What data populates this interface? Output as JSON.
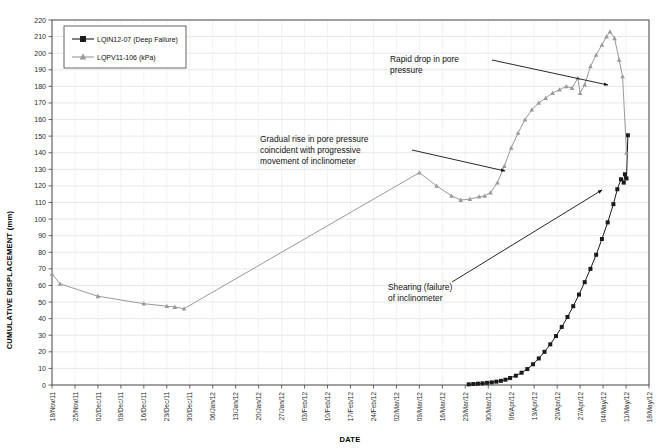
{
  "chart_data": {
    "type": "line",
    "title": "",
    "xlabel": "DATE",
    "ylabel": "CUMULATIVE DISPLACEMENT (mm)",
    "ylim": [
      0,
      220
    ],
    "ytick_step": 10,
    "grid": true,
    "legend_position": "top-left",
    "categories": [
      "18/Nov/11",
      "25/Nov/11",
      "02/Dec/11",
      "09/Dec/11",
      "16/Dec/11",
      "23/Dec/11",
      "30/Dec/11",
      "06/Jan/12",
      "13/Jan/12",
      "20/Jan/12",
      "27/Jan/12",
      "03/Feb/12",
      "10/Feb/12",
      "17/Feb/12",
      "24/Feb/12",
      "02/Mar/12",
      "09/Mar/12",
      "16/Mar/12",
      "23/Mar/12",
      "30/Mar/12",
      "06/Apr/12",
      "13/Apr/12",
      "20/Apr/12",
      "27/Apr/12",
      "04/May/12",
      "11/May/12",
      "18/May/12"
    ],
    "yticks": [
      0,
      10,
      20,
      30,
      40,
      50,
      60,
      70,
      80,
      90,
      100,
      110,
      120,
      130,
      140,
      150,
      160,
      170,
      180,
      190,
      200,
      210,
      220
    ],
    "series": [
      {
        "name": "LQIN12-07 (Deep Failure)",
        "color": "#1a1a1a",
        "marker": "square",
        "points": [
          {
            "x": 18.15,
            "y": 0.4
          },
          {
            "x": 18.35,
            "y": 0.6
          },
          {
            "x": 18.55,
            "y": 0.8
          },
          {
            "x": 18.75,
            "y": 1.0
          },
          {
            "x": 18.95,
            "y": 1.3
          },
          {
            "x": 19.15,
            "y": 1.6
          },
          {
            "x": 19.35,
            "y": 2.0
          },
          {
            "x": 19.55,
            "y": 2.5
          },
          {
            "x": 19.75,
            "y": 3.2
          },
          {
            "x": 19.95,
            "y": 4.2
          },
          {
            "x": 20.2,
            "y": 5.6
          },
          {
            "x": 20.45,
            "y": 7.4
          },
          {
            "x": 20.7,
            "y": 9.6
          },
          {
            "x": 20.95,
            "y": 12.5
          },
          {
            "x": 21.2,
            "y": 16.0
          },
          {
            "x": 21.45,
            "y": 20.0
          },
          {
            "x": 21.7,
            "y": 24.5
          },
          {
            "x": 21.95,
            "y": 29.5
          },
          {
            "x": 22.2,
            "y": 35.0
          },
          {
            "x": 22.45,
            "y": 41.0
          },
          {
            "x": 22.7,
            "y": 47.5
          },
          {
            "x": 22.95,
            "y": 54.5
          },
          {
            "x": 23.2,
            "y": 62.0
          },
          {
            "x": 23.45,
            "y": 70.0
          },
          {
            "x": 23.7,
            "y": 78.5
          },
          {
            "x": 23.95,
            "y": 88.0
          },
          {
            "x": 24.2,
            "y": 98.0
          },
          {
            "x": 24.45,
            "y": 109.0
          },
          {
            "x": 24.62,
            "y": 118.0
          },
          {
            "x": 24.78,
            "y": 124.0
          },
          {
            "x": 24.9,
            "y": 122.0
          },
          {
            "x": 24.95,
            "y": 127.0
          },
          {
            "x": 25.02,
            "y": 124.5
          },
          {
            "x": 25.08,
            "y": 150.5
          }
        ]
      },
      {
        "name": "LQPV11-106 (kPa)",
        "color": "#9a9a9a",
        "marker": "triangle",
        "points": [
          {
            "x": 0.0,
            "y": 67.0
          },
          {
            "x": 0.35,
            "y": 61.0
          },
          {
            "x": 2.0,
            "y": 53.5
          },
          {
            "x": 4.0,
            "y": 49.0
          },
          {
            "x": 5.0,
            "y": 47.5
          },
          {
            "x": 5.35,
            "y": 47.0
          },
          {
            "x": 5.75,
            "y": 46.0
          },
          {
            "x": 16.0,
            "y": 128.0
          },
          {
            "x": 16.75,
            "y": 120.0
          },
          {
            "x": 17.4,
            "y": 114.0
          },
          {
            "x": 17.8,
            "y": 111.5
          },
          {
            "x": 18.2,
            "y": 112.0
          },
          {
            "x": 18.6,
            "y": 113.5
          },
          {
            "x": 18.85,
            "y": 114.0
          },
          {
            "x": 19.1,
            "y": 116.0
          },
          {
            "x": 19.4,
            "y": 122.0
          },
          {
            "x": 19.7,
            "y": 132.0
          },
          {
            "x": 20.0,
            "y": 143.0
          },
          {
            "x": 20.3,
            "y": 152.0
          },
          {
            "x": 20.6,
            "y": 160.0
          },
          {
            "x": 20.9,
            "y": 166.0
          },
          {
            "x": 21.2,
            "y": 170.0
          },
          {
            "x": 21.5,
            "y": 173.0
          },
          {
            "x": 21.8,
            "y": 176.0
          },
          {
            "x": 22.1,
            "y": 178.0
          },
          {
            "x": 22.4,
            "y": 180.0
          },
          {
            "x": 22.65,
            "y": 179.0
          },
          {
            "x": 22.9,
            "y": 185.0
          },
          {
            "x": 23.0,
            "y": 176.0
          },
          {
            "x": 23.2,
            "y": 181.0
          },
          {
            "x": 23.45,
            "y": 192.0
          },
          {
            "x": 23.7,
            "y": 199.0
          },
          {
            "x": 23.95,
            "y": 205.0
          },
          {
            "x": 24.15,
            "y": 210.0
          },
          {
            "x": 24.3,
            "y": 213.0
          },
          {
            "x": 24.5,
            "y": 209.0
          },
          {
            "x": 24.7,
            "y": 196.0
          },
          {
            "x": 24.85,
            "y": 186.0
          },
          {
            "x": 25.02,
            "y": 140.0
          }
        ]
      }
    ],
    "annotations": [
      {
        "id": "rapid-drop",
        "lines": [
          "Rapid drop in pore",
          "pressure"
        ],
        "text_x": 390,
        "text_y": 62,
        "leader": {
          "x1": 492,
          "y1": 60,
          "x2": 608,
          "y2": 85
        }
      },
      {
        "id": "gradual-rise",
        "lines": [
          "Gradual rise in pore pressure",
          "coincident with progressive",
          "movement of inclinometer"
        ],
        "text_x": 260,
        "text_y": 142,
        "leader": {
          "x1": 412,
          "y1": 150,
          "x2": 505,
          "y2": 171
        }
      },
      {
        "id": "shearing-failure",
        "lines": [
          "Shearing (failure)",
          "of inclinometer"
        ],
        "text_x": 388,
        "text_y": 290,
        "leader": {
          "x1": 452,
          "y1": 282,
          "x2": 602,
          "y2": 190
        }
      }
    ]
  }
}
